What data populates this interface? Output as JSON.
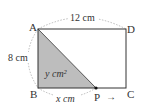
{
  "diagram": {
    "vertices": {
      "A": "A",
      "B": "B",
      "C": "C",
      "D": "D",
      "P": "P"
    },
    "labels": {
      "top_side": "12 cm",
      "left_side": "8 cm",
      "bottom_segment": "x cm",
      "area": "y cm²"
    },
    "arrow": "→",
    "colors": {
      "shade": "#bdbdbd",
      "stroke": "#333333",
      "dashed": "#aaaaaa"
    }
  }
}
